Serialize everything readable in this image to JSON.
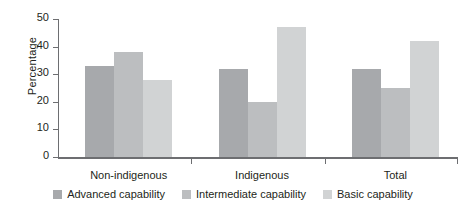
{
  "chart_data": {
    "type": "bar",
    "title": "",
    "xlabel": "",
    "ylabel": "Percentage",
    "categories": [
      "Non-indigenous",
      "Indigenous",
      "Total"
    ],
    "series": [
      {
        "name": "Advanced capability",
        "color": "#a7a9ac",
        "values": [
          33,
          32,
          32
        ]
      },
      {
        "name": "Intermediate capability",
        "color": "#bcbec0",
        "values": [
          38,
          20,
          25
        ]
      },
      {
        "name": "Basic capability",
        "color": "#d1d3d4",
        "values": [
          28,
          47,
          42
        ]
      }
    ],
    "ylim": [
      0,
      50
    ],
    "yticks": [
      0,
      10,
      20,
      30,
      40,
      50
    ],
    "ytick_labels": [
      "0",
      "10",
      "20",
      "30",
      "40",
      "50"
    ],
    "grid": false,
    "legend_position": "bottom"
  },
  "axis": {
    "line_color": "#6d6e71"
  }
}
